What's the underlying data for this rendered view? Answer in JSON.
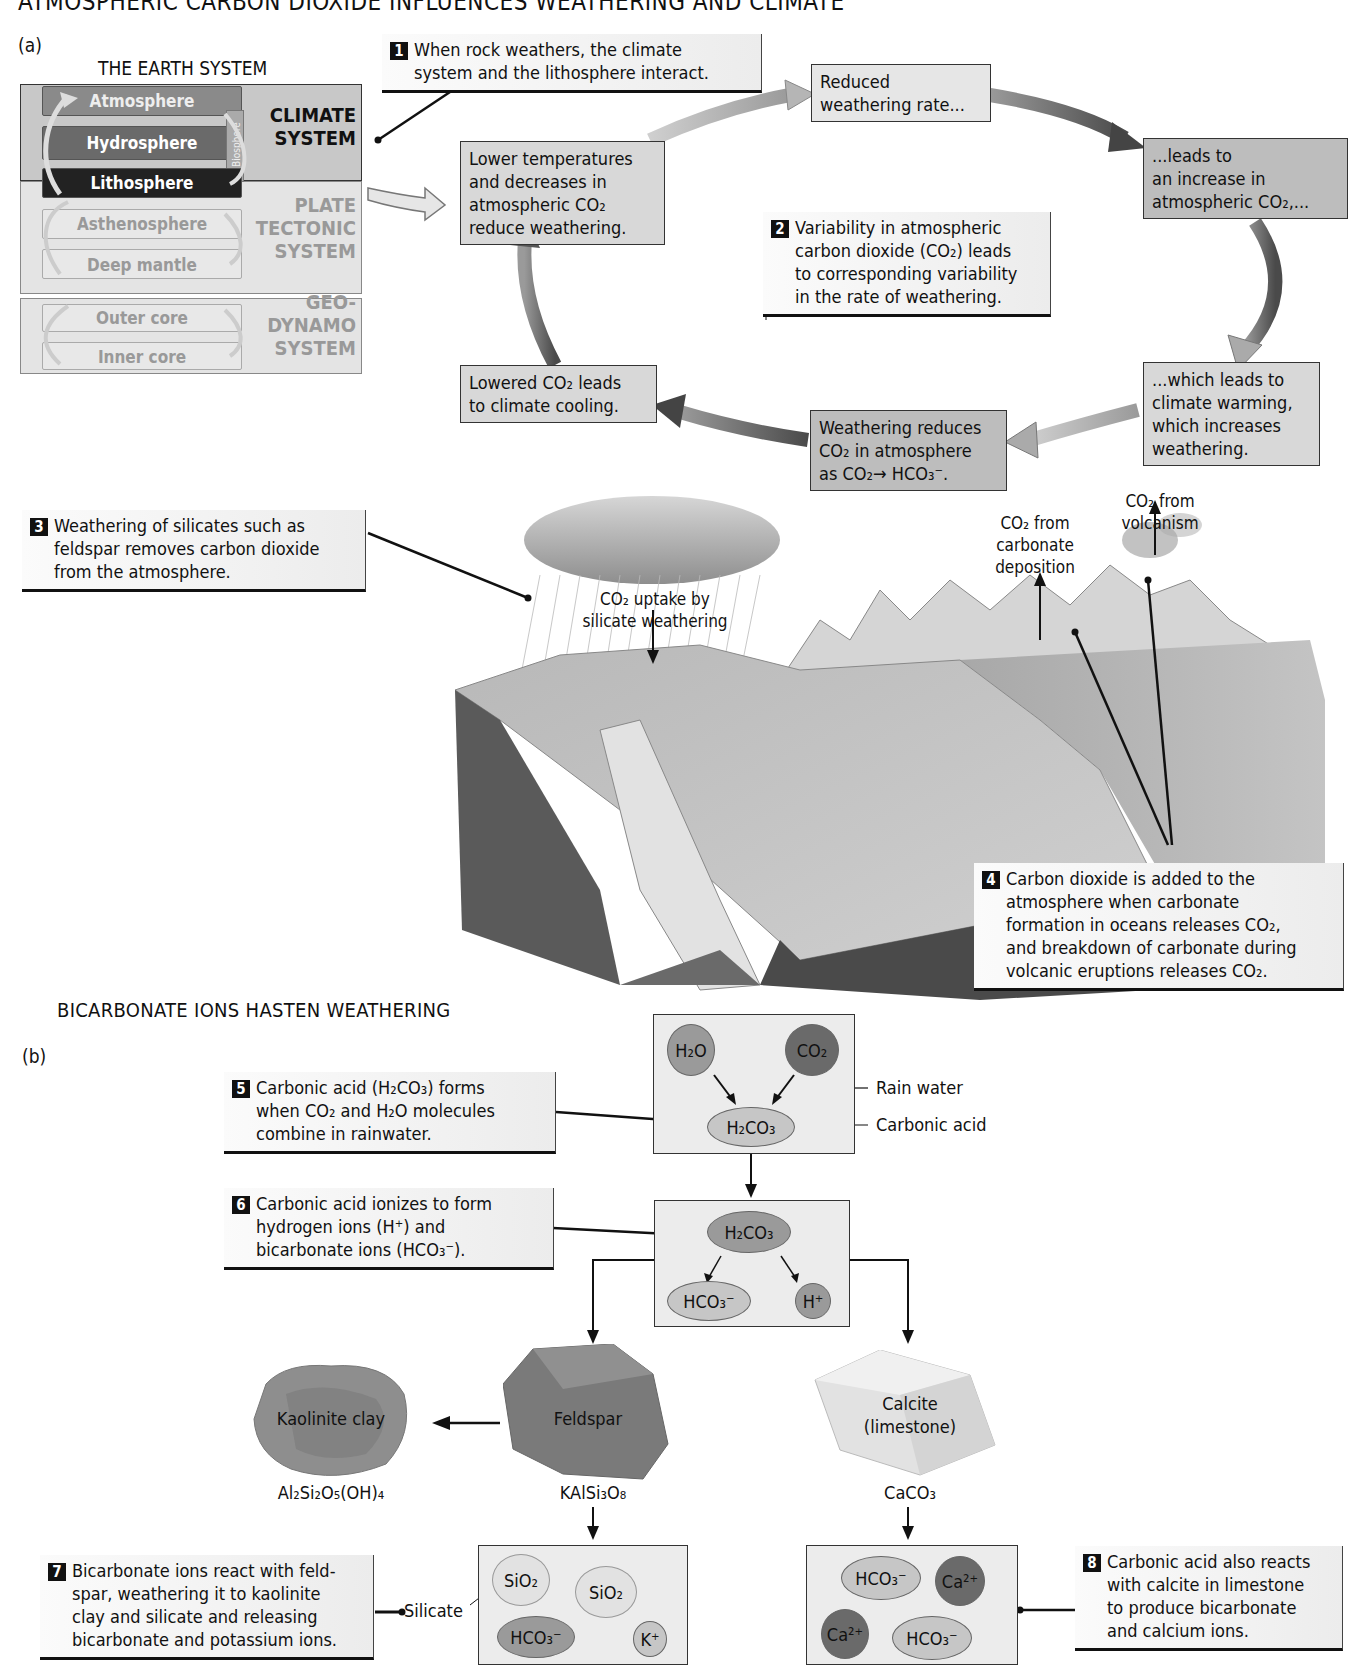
{
  "figure": {
    "title": "ATMOSPHERIC CARBON DIOXIDE INFLUENCES WEATHERING AND CLIMATE",
    "part_a_label": "(a)",
    "part_b_label": "(b)",
    "section_b_heading": "BICARBONATE IONS HASTEN WEATHERING"
  },
  "earth_system": {
    "title": "THE EARTH SYSTEM",
    "layers": {
      "atmosphere": "Atmosphere",
      "hydrosphere": "Hydrosphere",
      "biosphere": "Biosphere",
      "lithosphere": "Lithosphere",
      "asthenosphere": "Asthenosphere",
      "deep_mantle": "Deep mantle",
      "outer_core": "Outer core",
      "inner_core": "Inner core"
    },
    "systems": {
      "climate": [
        "CLIMATE",
        "SYSTEM"
      ],
      "plate_tectonic": [
        "PLATE",
        "TECTONIC",
        "SYSTEM"
      ],
      "geodynamo": [
        "GEO-",
        "DYNAMO",
        "SYSTEM"
      ]
    }
  },
  "callouts": {
    "c1": {
      "num": "1",
      "lines": [
        "When rock weathers, the climate",
        "system and the lithosphere interact."
      ]
    },
    "c2": {
      "num": "2",
      "lines": [
        "Variability in atmospheric",
        "carbon dioxide (CO₂) leads",
        "to corresponding variability",
        "in the rate of weathering."
      ]
    },
    "c3": {
      "num": "3",
      "lines": [
        "Weathering of silicates such as",
        "feldspar removes carbon dioxide",
        "from the atmosphere."
      ]
    },
    "c4": {
      "num": "4",
      "lines": [
        "Carbon dioxide is added to the",
        "atmosphere when carbonate",
        "formation in oceans releases CO₂,",
        "and breakdown of carbonate during",
        "volcanic eruptions releases CO₂."
      ]
    },
    "c5": {
      "num": "5",
      "lines": [
        "Carbonic acid (H₂CO₃) forms",
        "when CO₂ and H₂O molecules",
        "combine in rainwater."
      ]
    },
    "c6": {
      "num": "6",
      "lines": [
        "Carbonic acid ionizes to form",
        "hydrogen ions (H⁺) and",
        "bicarbonate ions (HCO₃⁻)."
      ]
    },
    "c7": {
      "num": "7",
      "lines": [
        "Bicarbonate ions react with feld-",
        "spar, weathering it to kaolinite",
        "clay and silicate and releasing",
        "bicarbonate and potassium ions."
      ]
    },
    "c8": {
      "num": "8",
      "lines": [
        "Carbonic acid also reacts",
        "with calcite in limestone",
        "to produce bicarbonate",
        "and calcium ions."
      ]
    }
  },
  "cycle": {
    "lower_temps": [
      "Lower temperatures",
      "and decreases in",
      "atmospheric CO₂",
      "reduce weathering."
    ],
    "reduced_rate": [
      "Reduced",
      "weathering rate..."
    ],
    "leads_increase": [
      "...leads  to",
      "an increase in",
      "atmospheric CO₂,..."
    ],
    "climate_warming": [
      "...which leads to",
      "climate warming,",
      "which increases",
      "weathering."
    ],
    "weathering_reduces": [
      "Weathering reduces",
      "CO₂ in atmosphere",
      "as  CO₂→ HCO₃⁻."
    ],
    "lowered_co2": [
      "Lowered CO₂ leads",
      "to climate cooling."
    ]
  },
  "landscape": {
    "uptake_label": [
      "CO₂ uptake by",
      "silicate weathering"
    ],
    "carbonate_label": [
      "CO₂ from",
      "carbonate",
      "deposition"
    ],
    "volcanism_label": [
      "CO₂ from",
      "volcanism"
    ]
  },
  "chemistry": {
    "h2o": "H₂O",
    "co2": "CO₂",
    "h2co3": "H₂CO₃",
    "rain_water": "Rain water",
    "carbonic_acid": "Carbonic acid",
    "hco3": "HCO₃⁻",
    "h_plus": "H⁺",
    "kaolinite": "Kaolinite clay",
    "kaolinite_formula": "Al₂Si₂O₅(OH)₄",
    "feldspar": "Feldspar",
    "feldspar_formula": "KAlSi₃O₈",
    "calcite": [
      "Calcite",
      "(limestone)"
    ],
    "calcite_formula": "CaCO₃",
    "sio2": "SiO₂",
    "k_plus": "K⁺",
    "ca2_plus": "Ca²⁺",
    "silicate_label": "Silicate"
  },
  "colors": {
    "box_light": "#e6e6e6",
    "box_mid": "#d8d8d8",
    "box_dark": "#bdbdbd",
    "arrow_dark": "#555555",
    "arrow_light": "#b0b0b0"
  }
}
